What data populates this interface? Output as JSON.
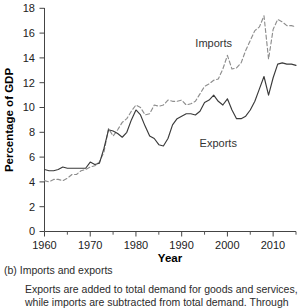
{
  "figure": {
    "caption_label": "(b) Imports and exports",
    "caption_text": "Exports are added to total demand for goods and services, while imports are subtracted from total demand. Through"
  },
  "axes": {
    "ylabel": "Percentage of GDP",
    "xlabel": "Year",
    "y_ticks": [
      "0",
      "2",
      "4",
      "6",
      "8",
      "10",
      "12",
      "14",
      "16",
      "18"
    ],
    "x_ticks": [
      "1960",
      "1970",
      "1980",
      "1990",
      "2000",
      "2010"
    ]
  },
  "labels": {
    "imports": "Imports",
    "exports": "Exports"
  },
  "colors": {
    "exports_line": "#3a3a3a",
    "imports_line": "#8e8e8e",
    "axis": "#444444",
    "text": "#222222"
  },
  "chart_data": {
    "type": "line",
    "title": "",
    "subtitle": "",
    "xlabel": "Year",
    "ylabel": "Percentage of GDP",
    "xlim": [
      1960,
      2015
    ],
    "ylim": [
      0,
      18
    ],
    "y_ticks": [
      0,
      2,
      4,
      6,
      8,
      10,
      12,
      14,
      16,
      18
    ],
    "x_ticks": [
      1960,
      1970,
      1980,
      1990,
      2000,
      2010
    ],
    "x_minor_tick_step": 5,
    "grid": false,
    "legend": "inline-annotations",
    "annotations": [
      {
        "text": "Imports",
        "x": 1997,
        "y": 14.9
      },
      {
        "text": "Exports",
        "x": 1998,
        "y": 6.8
      }
    ],
    "x": [
      1960,
      1961,
      1962,
      1963,
      1964,
      1965,
      1966,
      1967,
      1968,
      1969,
      1970,
      1971,
      1972,
      1973,
      1974,
      1975,
      1976,
      1977,
      1978,
      1979,
      1980,
      1981,
      1982,
      1983,
      1984,
      1985,
      1986,
      1987,
      1988,
      1989,
      1990,
      1991,
      1992,
      1993,
      1994,
      1995,
      1996,
      1997,
      1998,
      1999,
      2000,
      2001,
      2002,
      2003,
      2004,
      2005,
      2006,
      2007,
      2008,
      2009,
      2010,
      2011,
      2012,
      2013,
      2014,
      2015
    ],
    "series": [
      {
        "name": "Exports",
        "style": "solid",
        "color": "#3a3a3a",
        "values": [
          5.0,
          4.9,
          4.9,
          5.0,
          5.2,
          5.1,
          5.1,
          5.1,
          5.1,
          5.1,
          5.6,
          5.4,
          5.5,
          6.7,
          8.2,
          8.1,
          7.9,
          7.6,
          8.0,
          9.0,
          9.8,
          9.4,
          8.5,
          7.7,
          7.5,
          7.0,
          6.9,
          7.5,
          8.6,
          9.1,
          9.3,
          9.5,
          9.5,
          9.4,
          9.7,
          10.4,
          10.6,
          11.0,
          10.5,
          10.2,
          10.7,
          9.8,
          9.1,
          9.1,
          9.3,
          9.8,
          10.5,
          11.5,
          12.5,
          11.0,
          12.4,
          13.5,
          13.6,
          13.5,
          13.5,
          13.4
        ]
      },
      {
        "name": "Imports",
        "style": "dashed",
        "color": "#8e8e8e",
        "values": [
          4.1,
          4.0,
          4.2,
          4.2,
          4.1,
          4.3,
          4.6,
          4.6,
          4.9,
          5.0,
          5.2,
          5.3,
          5.6,
          6.4,
          8.3,
          7.7,
          8.2,
          8.8,
          9.1,
          9.7,
          10.2,
          10.0,
          9.4,
          9.5,
          10.2,
          10.1,
          10.2,
          10.6,
          10.5,
          10.5,
          10.6,
          10.2,
          10.3,
          10.5,
          11.1,
          11.7,
          11.9,
          12.2,
          12.3,
          13.1,
          14.2,
          13.1,
          13.2,
          13.6,
          14.6,
          15.4,
          16.2,
          16.5,
          17.4,
          13.9,
          16.3,
          17.1,
          16.9,
          16.6,
          16.6,
          16.5
        ]
      }
    ]
  }
}
